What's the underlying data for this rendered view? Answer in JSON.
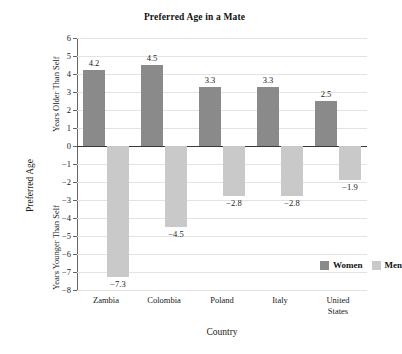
{
  "chart_data": {
    "type": "bar",
    "title": "Preferred Age in a Mate",
    "xlabel": "Country",
    "ylabel": "Preferred Age",
    "ylabel_upper": "Years Older Than Self",
    "ylabel_lower": "Years Younger Than Self",
    "categories": [
      "Zambia",
      "Colombia",
      "Poland",
      "Italy",
      "United States"
    ],
    "series": [
      {
        "name": "Women",
        "color": "#8a8a8a",
        "values": [
          4.2,
          4.5,
          3.3,
          3.3,
          2.5
        ]
      },
      {
        "name": "Men",
        "color": "#c9c9c9",
        "values": [
          -7.3,
          -4.5,
          -2.8,
          -2.8,
          -1.9
        ]
      }
    ],
    "value_labels": {
      "women": [
        "4.2",
        "4.5",
        "3.3",
        "3.3",
        "2.5"
      ],
      "men": [
        "−7.3",
        "−4.5",
        "−2.8",
        "−2.8",
        "−1.9"
      ]
    },
    "ylim": [
      -8,
      6
    ],
    "yticks": [
      6,
      5,
      4,
      3,
      2,
      1,
      0,
      -1,
      -2,
      -3,
      -4,
      -5,
      -6,
      -7,
      -8
    ],
    "ytick_labels": [
      "6",
      "5",
      "4",
      "3",
      "2",
      "1",
      "0",
      "−1",
      "−2",
      "−3",
      "−4",
      "−5",
      "−6",
      "−7",
      "−8"
    ],
    "grid": true,
    "legend_position": "inside-lower-right",
    "legend": [
      {
        "label": "Women",
        "color": "#8a8a8a"
      },
      {
        "label": "Men",
        "color": "#c9c9c9"
      }
    ]
  }
}
